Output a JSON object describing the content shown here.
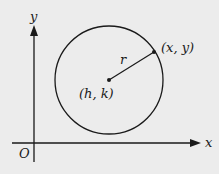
{
  "diagram": {
    "type": "circle-on-coordinate-plane",
    "background": "#ececec",
    "stroke": "#1a1a1a",
    "axes": {
      "x_label": "x",
      "y_label": "y",
      "origin_label": "O"
    },
    "circle": {
      "center_label": "(h, k)",
      "radius_label": "r",
      "point_label": "(x, y)"
    }
  }
}
